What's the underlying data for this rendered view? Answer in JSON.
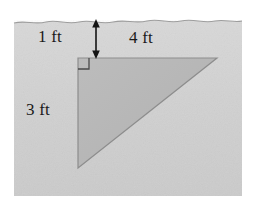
{
  "figure": {
    "name": "submerged-right-triangle-plate",
    "colors": {
      "page_background": "#ffffff",
      "water_fill": "#d2d2d2",
      "plate_fill": "#b6b6b6",
      "plate_stroke": "#8a8a8a",
      "surface_line": "#9a9a9a",
      "annotation": "#1a1a1a"
    },
    "water": {
      "region": {
        "x": 14,
        "y": 20,
        "width": 228,
        "height": 176
      },
      "surface_label": "water-surface-wavy-line"
    },
    "plate": {
      "shape": "right-triangle",
      "vertices": [
        {
          "name": "right-angle-corner",
          "x": 78,
          "y": 58
        },
        {
          "name": "top-right-corner",
          "x": 217,
          "y": 58
        },
        {
          "name": "bottom-corner",
          "x": 78,
          "y": 168
        }
      ],
      "right_angle_marker": {
        "x": 78,
        "y": 58,
        "size": 11
      }
    },
    "dimensions": {
      "depth": {
        "label": "1 ft",
        "icon": "double-headed-vertical-arrow",
        "arrow": {
          "x": 96,
          "y_top": 21,
          "y_bottom": 58
        }
      },
      "top_edge": {
        "label": "4 ft"
      },
      "vertical_edge": {
        "label": "3 ft"
      }
    }
  }
}
